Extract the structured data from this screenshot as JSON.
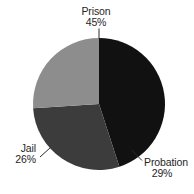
{
  "chart_data": {
    "type": "pie",
    "title": "",
    "subtitle": "",
    "xlabel": "",
    "ylabel": "",
    "legend_position": "none",
    "grid": false,
    "labels_inline": true,
    "units": "percent",
    "total": 100,
    "categories": [
      "Prison",
      "Probation",
      "Jail"
    ],
    "values": [
      45,
      29,
      26
    ],
    "value_labels": [
      "45%",
      "29%",
      "26%"
    ],
    "colors": [
      "#111111",
      "#3c3c3c",
      "#8d8d8d"
    ],
    "start_angle_deg": 0,
    "direction": "clockwise",
    "slices": [
      {
        "name": "Prison",
        "value": 45,
        "value_label": "45%",
        "color": "#111111",
        "start_angle_deg": 0,
        "end_angle_deg": 162,
        "label_position": "outside-top",
        "has_leader_line": true
      },
      {
        "name": "Probation",
        "value": 29,
        "value_label": "29%",
        "color": "#3c3c3c",
        "start_angle_deg": 162,
        "end_angle_deg": 266.4,
        "label_position": "outside-bottom-right",
        "has_leader_line": true
      },
      {
        "name": "Jail",
        "value": 26,
        "value_label": "26%",
        "color": "#8d8d8d",
        "start_angle_deg": 266.4,
        "end_angle_deg": 360,
        "label_position": "outside-bottom-left",
        "has_leader_line": true
      }
    ],
    "geometry": {
      "center_x": 99,
      "center_y": 104,
      "radius": 66
    }
  },
  "labels": {
    "prison": {
      "name": "Prison",
      "value": "45%"
    },
    "probation": {
      "name": "Probation",
      "value": "29%"
    },
    "jail": {
      "name": "Jail",
      "value": "26%"
    }
  },
  "colors": {
    "background": "#ffffff",
    "text": "#262626",
    "leader": "#2a2a2a",
    "prison_slice": "#111111",
    "probation_slice": "#3c3c3c",
    "jail_slice": "#8d8d8d"
  }
}
